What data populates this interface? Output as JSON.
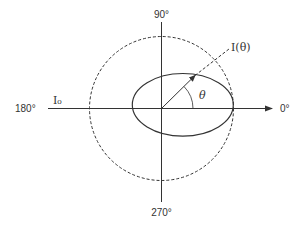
{
  "diagram": {
    "angle_labels": {
      "top": "90°",
      "right": "0°",
      "left": "180°",
      "bottom": "270°"
    },
    "reference_label": "I₀",
    "vector_label": "I(θ)",
    "angle_symbol": "θ",
    "colors": {
      "stroke": "#333333",
      "background": "#ffffff"
    },
    "shapes": {
      "reference_circle": "dashed circle (isotropic reference I₀)",
      "pattern": "solid ellipse, elongated along the 0° axis and tangent to the circle at 0°",
      "vector": "arrow from origin to the ellipse at angle θ",
      "vector_extension": "dashed line from the arrow tip toward the I(θ) label"
    }
  }
}
